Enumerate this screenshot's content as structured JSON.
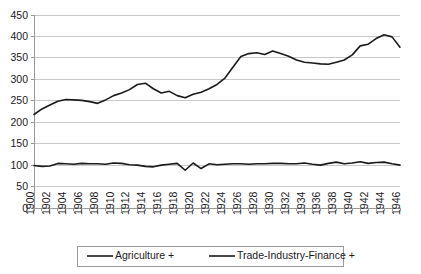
{
  "chart_data": {
    "type": "line",
    "title": "",
    "xlabel": "",
    "ylabel": "",
    "xlim": [
      1900,
      1946
    ],
    "ylim": [
      0,
      450
    ],
    "ytick_step": 50,
    "yticks": [
      0,
      50,
      100,
      150,
      200,
      250,
      300,
      350,
      400,
      450
    ],
    "xticks": [
      1900,
      1902,
      1904,
      1906,
      1908,
      1910,
      1912,
      1914,
      1916,
      1918,
      1920,
      1922,
      1924,
      1926,
      1928,
      1930,
      1932,
      1934,
      1936,
      1938,
      1940,
      1942,
      1944,
      1946
    ],
    "grid": true,
    "grid_axis": "y",
    "legend_position": "bottom",
    "x": [
      1900,
      1901,
      1902,
      1903,
      1904,
      1905,
      1906,
      1907,
      1908,
      1909,
      1910,
      1911,
      1912,
      1913,
      1914,
      1915,
      1916,
      1917,
      1918,
      1919,
      1920,
      1921,
      1922,
      1923,
      1924,
      1925,
      1926,
      1927,
      1928,
      1929,
      1930,
      1931,
      1932,
      1933,
      1934,
      1935,
      1936,
      1937,
      1938,
      1939,
      1940,
      1941,
      1942,
      1943,
      1944,
      1945,
      1946
    ],
    "series": [
      {
        "name": "Agriculture +",
        "color": "#1a1a1a",
        "values": [
          99,
          97,
          98,
          104,
          103,
          102,
          104,
          103,
          103,
          102,
          105,
          104,
          101,
          100,
          97,
          96,
          100,
          102,
          104,
          88,
          105,
          92,
          103,
          101,
          102,
          103,
          103,
          102,
          103,
          103,
          104,
          104,
          103,
          103,
          105,
          102,
          100,
          104,
          107,
          103,
          105,
          108,
          104,
          106,
          107,
          103,
          100
        ]
      },
      {
        "name": "Trade-Industry-Finance +",
        "color": "#1a1a1a",
        "values": [
          218,
          231,
          240,
          249,
          253,
          252,
          251,
          248,
          244,
          252,
          262,
          268,
          276,
          288,
          291,
          278,
          268,
          272,
          262,
          257,
          265,
          270,
          278,
          288,
          303,
          328,
          353,
          360,
          362,
          358,
          366,
          360,
          354,
          345,
          340,
          338,
          336,
          335,
          340,
          345,
          357,
          378,
          382,
          395,
          404,
          399,
          375
        ]
      }
    ]
  },
  "legend": {
    "items": [
      {
        "label": "Agriculture +"
      },
      {
        "label": "Trade-Industry-Finance +"
      }
    ]
  },
  "axis_labels": {
    "y": [
      "450",
      "400",
      "350",
      "300",
      "250",
      "200",
      "150",
      "100",
      "50",
      "0"
    ],
    "x": [
      "1900",
      "1902",
      "1904",
      "1906",
      "1908",
      "1910",
      "1912",
      "1914",
      "1916",
      "1918",
      "1920",
      "1922",
      "1924",
      "1926",
      "1928",
      "1930",
      "1932",
      "1934",
      "1936",
      "1938",
      "1940",
      "1942",
      "1944",
      "1946"
    ]
  },
  "colors": {
    "line": "#1a1a1a",
    "grid": "#c9c9c9",
    "axis": "#9a9a9a",
    "legend_border": "#9a9a9a",
    "background": "#ffffff"
  }
}
